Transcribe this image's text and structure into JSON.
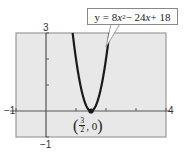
{
  "chart_data": {
    "type": "line",
    "title": "",
    "equation_label": "y = 8x^2 - 24x + 18",
    "equation_parts": {
      "prefix": "y = 8",
      "var1": "x",
      "exp": "2",
      "mid": " − 24",
      "var2": "x",
      "suffix": " + 18"
    },
    "xlabel": "",
    "ylabel": "",
    "xlim": [
      -1,
      4
    ],
    "ylim": [
      -1,
      3
    ],
    "x_tick_step": 1,
    "y_tick_step": 1,
    "tick_labels": {
      "xmin": "−1",
      "xmax": "4",
      "ymin": "−1",
      "ymax": "3"
    },
    "grid": false,
    "series": [
      {
        "name": "y = 8x^2 - 24x + 18",
        "function": "8*x*x - 24*x + 18",
        "x": [
          0.887,
          1.0,
          1.25,
          1.5,
          1.75,
          2.0,
          2.113
        ],
        "y": [
          3.0,
          2.0,
          0.5,
          0.0,
          0.5,
          2.0,
          3.0
        ]
      }
    ],
    "annotations": [
      {
        "text": "(3/2, 0)",
        "x": 1.5,
        "y": 0,
        "num": "3",
        "den": "2",
        "yval": "0",
        "marker": "point"
      }
    ],
    "colors": {
      "background": "#e8e8e8",
      "curve": "#1a1a1a",
      "axis": "#555555",
      "frame": "#888888"
    }
  }
}
